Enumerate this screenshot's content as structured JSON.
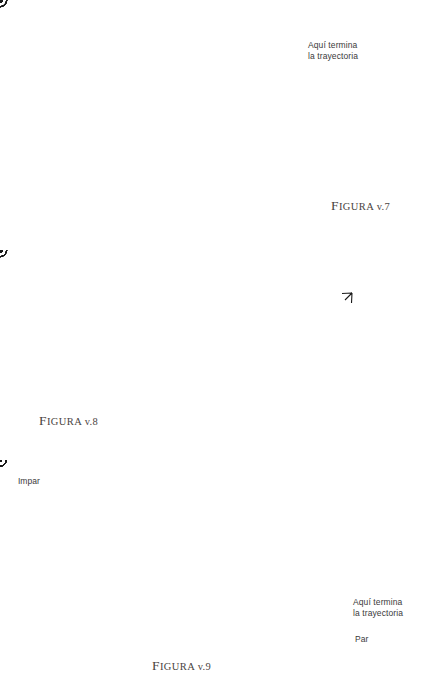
{
  "page": {
    "width": 433,
    "height": 693,
    "background": "#ffffff",
    "ink": "#1a1a1a",
    "caption_color": "#4a4442"
  },
  "figures": [
    {
      "id": "figura-v7",
      "caption_first": "F",
      "caption_rest": "IGURA",
      "caption_number": "v.7",
      "caption_full": "Figura v.7",
      "annotation": "Aquí termina\nla trayectoria",
      "frame": {
        "x": 33,
        "y": 43,
        "width": 266,
        "height": 167
      },
      "grid": {
        "cols": 6,
        "rows": 4
      },
      "description": "Rectángulo con retícula de puntos; puntos circulados en patrón de damero",
      "circled_nodes": [
        [
          1,
          0
        ],
        [
          3,
          0
        ],
        [
          5,
          0
        ],
        [
          0,
          1
        ],
        [
          2,
          1
        ],
        [
          4,
          1
        ],
        [
          1,
          2
        ],
        [
          3,
          2
        ],
        [
          5,
          2
        ],
        [
          0,
          3
        ],
        [
          2,
          3
        ],
        [
          4,
          3
        ]
      ]
    },
    {
      "id": "figura-v8",
      "caption_first": "F",
      "caption_rest": "IGURA",
      "caption_number": "v.8",
      "caption_full": "Figura v.8",
      "annotation": "",
      "frame": {
        "x": 126,
        "y": 263,
        "width": 267,
        "height": 171
      },
      "grid": {
        "cols": 6,
        "rows": 4
      },
      "description": "Rectángulo con trayectoria diagonal en zigzag formando rombos",
      "circled_nodes": [
        [
          1,
          0
        ],
        [
          3,
          0
        ],
        [
          5,
          0
        ],
        [
          0,
          1
        ],
        [
          2,
          1
        ],
        [
          4,
          1
        ],
        [
          1,
          2
        ],
        [
          3,
          2
        ],
        [
          5,
          2
        ],
        [
          0,
          3
        ],
        [
          2,
          3
        ],
        [
          4,
          3
        ]
      ],
      "arrow": {
        "label": "flecha de dirección",
        "x": 352,
        "y": 293
      }
    },
    {
      "id": "figura-v9",
      "caption_first": "F",
      "caption_rest": "IGURA",
      "caption_number": "v.9",
      "caption_full": "Figura v.9",
      "annotation": "Aquí termina\nla trayectoria",
      "label_odd": "Impar",
      "label_even": "Par",
      "frame": {
        "x": 57,
        "y": 479,
        "width": 287,
        "height": 150
      },
      "grid": {
        "cols": 10,
        "rows": 6
      },
      "description": "Rectángulo con retícula densa de puntos en damero",
      "circled_nodes": []
    }
  ],
  "annotations": {
    "end_of_trajectory": "Aquí termina\nla trayectoria",
    "odd": "Impar",
    "even": "Par"
  }
}
